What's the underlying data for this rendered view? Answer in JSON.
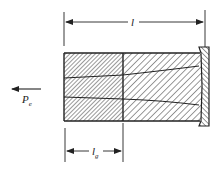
{
  "diagram": {
    "type": "engineering-cross-section",
    "labels": {
      "overall_length": "l",
      "gauge_length_main": "l",
      "gauge_length_sub": "g",
      "force_main": "P",
      "force_sub": "e"
    },
    "colors": {
      "stroke": "#222222",
      "background": "#ffffff"
    }
  }
}
